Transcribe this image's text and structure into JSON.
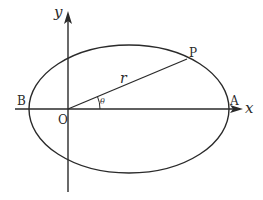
{
  "diagram": {
    "type": "ellipse-polar-coordinates",
    "colors": {
      "stroke": "#2a2a2a",
      "background": "#ffffff"
    },
    "axes": {
      "x_label": "x",
      "y_label": "y"
    },
    "points": {
      "origin": "O",
      "left_vertex": "B",
      "right_vertex": "A",
      "point_on_curve": "P"
    },
    "segment_label": "r",
    "angle_label": "θ"
  }
}
